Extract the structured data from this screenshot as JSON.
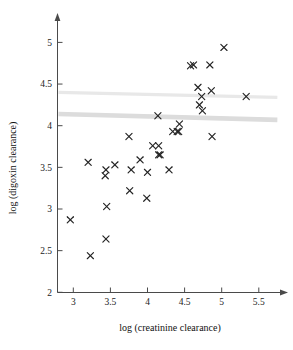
{
  "chart_data": {
    "type": "scatter",
    "title": "",
    "xlabel": "log (creatinine clearance)",
    "ylabel": "log (digoxin clearance)",
    "xlim": [
      2.8,
      5.75
    ],
    "ylim": [
      2.0,
      5.2
    ],
    "xticks": [
      3,
      3.5,
      4,
      4.5,
      5,
      5.5
    ],
    "xtick_labels": [
      "3",
      "3.5",
      "4",
      "4.5",
      "5",
      "5.5"
    ],
    "yticks": [
      2,
      2.5,
      3,
      3.5,
      4,
      4.5,
      5
    ],
    "ytick_labels": [
      "2",
      "2.5",
      "3",
      "3.5",
      "4",
      "4.5",
      "5"
    ],
    "grid": false,
    "legend": null,
    "marker": "x",
    "marker_color": "#232323",
    "points": [
      {
        "x": 2.96,
        "y": 2.87
      },
      {
        "x": 3.23,
        "y": 2.44
      },
      {
        "x": 3.2,
        "y": 3.56
      },
      {
        "x": 3.44,
        "y": 2.64
      },
      {
        "x": 3.45,
        "y": 3.03
      },
      {
        "x": 3.44,
        "y": 3.47
      },
      {
        "x": 3.43,
        "y": 3.4
      },
      {
        "x": 3.56,
        "y": 3.53
      },
      {
        "x": 3.75,
        "y": 3.87
      },
      {
        "x": 3.76,
        "y": 3.22
      },
      {
        "x": 3.78,
        "y": 3.47
      },
      {
        "x": 3.9,
        "y": 3.59
      },
      {
        "x": 3.99,
        "y": 3.13
      },
      {
        "x": 4.0,
        "y": 3.44
      },
      {
        "x": 4.07,
        "y": 3.76
      },
      {
        "x": 4.15,
        "y": 3.76
      },
      {
        "x": 4.15,
        "y": 3.65
      },
      {
        "x": 4.17,
        "y": 3.65
      },
      {
        "x": 4.14,
        "y": 4.12
      },
      {
        "x": 4.29,
        "y": 3.47
      },
      {
        "x": 4.34,
        "y": 3.93
      },
      {
        "x": 4.4,
        "y": 3.93
      },
      {
        "x": 4.42,
        "y": 3.93
      },
      {
        "x": 4.43,
        "y": 4.02
      },
      {
        "x": 4.58,
        "y": 4.72
      },
      {
        "x": 4.62,
        "y": 4.73
      },
      {
        "x": 4.68,
        "y": 4.46
      },
      {
        "x": 4.7,
        "y": 4.25
      },
      {
        "x": 4.73,
        "y": 4.35
      },
      {
        "x": 4.74,
        "y": 4.18
      },
      {
        "x": 4.84,
        "y": 4.73
      },
      {
        "x": 4.86,
        "y": 4.42
      },
      {
        "x": 4.87,
        "y": 3.87
      },
      {
        "x": 5.03,
        "y": 4.94
      },
      {
        "x": 5.33,
        "y": 4.35
      }
    ],
    "reference_lines": [
      {
        "name": "upper-band",
        "x0": 2.8,
        "y0": 4.4,
        "x1": 5.75,
        "y1": 4.34,
        "color": "#e8e8e8"
      },
      {
        "name": "lower-band",
        "x0": 2.8,
        "y0": 4.14,
        "x1": 5.75,
        "y1": 4.07,
        "color": "#dcdcdc"
      }
    ]
  }
}
